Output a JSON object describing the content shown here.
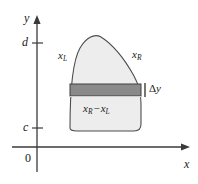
{
  "figure": {
    "type": "math-diagram",
    "axes": {
      "y_label": "y",
      "x_label": "x",
      "origin_label": "0",
      "y_tick_upper": "d",
      "y_tick_lower": "c"
    },
    "labels": {
      "left_curve": {
        "base": "x",
        "sub": "L"
      },
      "right_curve": {
        "base": "x",
        "sub": "R"
      },
      "strip_thickness": {
        "delta": "Δ",
        "var": "y"
      },
      "strip_width": {
        "left_base": "x",
        "left_sub": "R",
        "operator": "−",
        "right_base": "x",
        "right_sub": "L"
      }
    },
    "colors": {
      "region_fill": "#ededed",
      "strip_fill": "#8a8a8a",
      "outline": "#4d4d4d",
      "axis": "#3a3a3a",
      "text": "#1a1a1a",
      "background": "#ffffff"
    },
    "geometry": {
      "y_axis_x": 37,
      "x_axis_y": 147,
      "tick_d_y": 43,
      "tick_c_y": 128,
      "region_left_x": 70,
      "region_right_x": 141,
      "region_top_y": 36,
      "region_bottom_y": 130,
      "strip_top_y": 84,
      "strip_bottom_y": 96
    }
  }
}
